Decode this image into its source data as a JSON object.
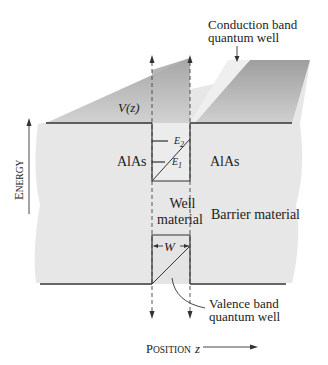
{
  "diagram": {
    "type": "quantum-well band diagram",
    "labels": {
      "conduction_note_line1": "Conduction band",
      "conduction_note_line2": "quantum well",
      "potential": "V(z)",
      "E2": "E2",
      "E1": "E1",
      "left_material": "AlAs",
      "right_material": "AlAs",
      "well_material_line1": "Well",
      "well_material_line2": "material",
      "barrier_material": "Barrier material",
      "width": "W",
      "valence_note_line1": "Valence band",
      "valence_note_line2": "quantum well",
      "energy_axis_first": "E",
      "energy_axis_rest": "NERGY",
      "position_axis_first": "P",
      "position_axis_rest": "OSITION",
      "position_var": "z"
    },
    "colors": {
      "background": "#ffffff",
      "slab_light": "#e6e6e6",
      "slab_dark": "#a9a9a9",
      "line": "#333333"
    }
  }
}
